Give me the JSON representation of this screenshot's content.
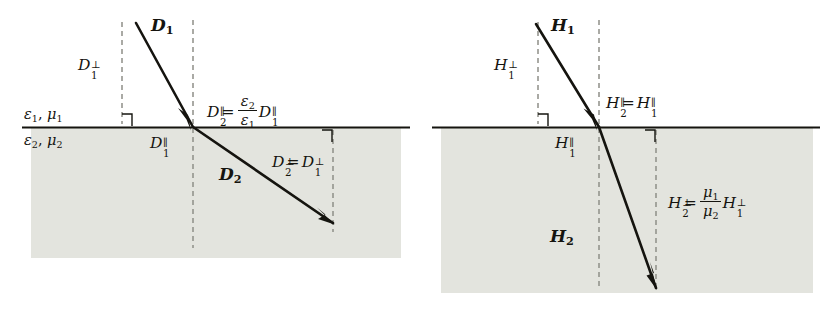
{
  "figure": {
    "background_color": "#ffffff",
    "ink_color": "#15140f",
    "medium2_fill_color": "#e3e4de",
    "dashed_line_color": "#8e8f88"
  },
  "panels": [
    {
      "id": "panel-d",
      "field_symbol": "D",
      "incident_vector_label": "D",
      "incident_vector_sub": "1",
      "refracted_vector_label": "D",
      "refracted_vector_sub": "2",
      "media": {
        "upper": {
          "epsilon": "ε",
          "epsilon_sub": "1",
          "mu": "μ",
          "mu_sub": "1",
          "comma": ", "
        },
        "lower": {
          "epsilon": "ε",
          "epsilon_sub": "2",
          "mu": "μ",
          "mu_sub": "2",
          "comma": ", "
        }
      },
      "components": {
        "incident_perp": {
          "base": "D",
          "sup": "⊥",
          "sub": "1"
        },
        "incident_para": {
          "base": "D",
          "sup": "∥",
          "sub": "1"
        }
      },
      "equations": [
        {
          "id": "parallel-relation",
          "lhs_base": "D",
          "lhs_sup": "∥",
          "lhs_sub": "2",
          "relation": "=",
          "frac_num_base": "ε",
          "frac_num_sub": "2",
          "frac_den_base": "ε",
          "frac_den_sub": "1",
          "rhs_base": "D",
          "rhs_sup": "∥",
          "rhs_sub": "1"
        },
        {
          "id": "perpendicular-relation",
          "lhs_base": "D",
          "lhs_sup": "⊥",
          "lhs_sub": "2",
          "relation": "=",
          "rhs_base": "D",
          "rhs_sup": "⊥",
          "rhs_sub": "1"
        }
      ]
    },
    {
      "id": "panel-h",
      "field_symbol": "H",
      "incident_vector_label": "H",
      "incident_vector_sub": "1",
      "refracted_vector_label": "H",
      "refracted_vector_sub": "2",
      "components": {
        "incident_perp": {
          "base": "H",
          "sup": "⊥",
          "sub": "1"
        },
        "incident_para": {
          "base": "H",
          "sup": "∥",
          "sub": "1"
        }
      },
      "equations": [
        {
          "id": "parallel-relation",
          "lhs_base": "H",
          "lhs_sup": "∥",
          "lhs_sub": "2",
          "relation": "=",
          "rhs_base": "H",
          "rhs_sup": "∥",
          "rhs_sub": "1"
        },
        {
          "id": "perpendicular-relation",
          "lhs_base": "H",
          "lhs_sup": "⊥",
          "lhs_sub": "2",
          "relation": "=",
          "frac_num_base": "μ",
          "frac_num_sub": "1",
          "frac_den_base": "μ",
          "frac_den_sub": "2",
          "rhs_base": "H",
          "rhs_sup": "⊥",
          "rhs_sub": "1"
        }
      ]
    }
  ]
}
